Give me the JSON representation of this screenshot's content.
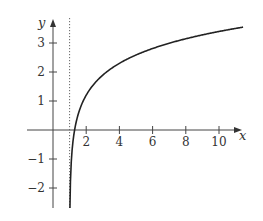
{
  "chart_data": {
    "type": "line",
    "title": "",
    "xlabel": "x",
    "ylabel": "y",
    "xlim": [
      -1.5,
      11.8
    ],
    "ylim": [
      -2.7,
      3.8
    ],
    "x_ticks": [
      2,
      4,
      6,
      8,
      10
    ],
    "x_tick_labels": [
      "2",
      "4",
      "6",
      "8",
      "10"
    ],
    "y_ticks": [
      -2,
      -1,
      1,
      2,
      3
    ],
    "y_tick_labels": [
      "−2",
      "−1",
      "1",
      "2",
      "3"
    ],
    "grid": false,
    "asymptote": {
      "x": 1,
      "style": "dotted"
    },
    "series": [
      {
        "name": "curve",
        "x": [
          1.01,
          1.05,
          1.1,
          1.2,
          1.3,
          1.5,
          2,
          3,
          4,
          5,
          6,
          7,
          8,
          9,
          10,
          11.5
        ],
        "y": [
          -2.6,
          -1.8,
          -1.1,
          -0.4,
          0.0,
          0.5,
          1.2,
          1.9,
          2.3,
          2.6,
          2.8,
          3.0,
          3.15,
          3.28,
          3.4,
          3.55
        ]
      }
    ]
  }
}
